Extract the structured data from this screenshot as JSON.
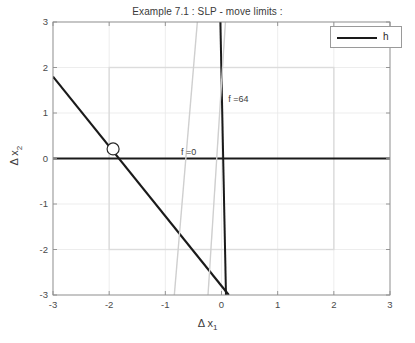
{
  "figure": {
    "title": "Example 7.1 : SLP - move limits :",
    "width": 415,
    "height": 343
  },
  "legend": {
    "entries": [
      {
        "label": "h",
        "color": "#1a1a1a"
      }
    ]
  },
  "chart_data": {
    "type": "line",
    "title": "Example 7.1 : SLP - move limits :",
    "xlabel": "Δ x₁",
    "ylabel": "Δ x₂",
    "xlabel_base": "Δ x",
    "xlabel_sub": "1",
    "ylabel_base": "Δ x",
    "ylabel_sub": "2",
    "xlim": [
      -3,
      3
    ],
    "ylim": [
      -3,
      3
    ],
    "xticks": [
      -3,
      -2,
      -1,
      0,
      1,
      2,
      3
    ],
    "yticks": [
      -3,
      -2,
      -1,
      0,
      1,
      2,
      3
    ],
    "xticklabels": [
      "-3",
      "-2",
      "-1",
      "0",
      "1",
      "2",
      "3"
    ],
    "yticklabels": [
      "-3",
      "-2",
      "-1",
      "0",
      "1",
      "2",
      "3"
    ],
    "grid": true,
    "grid_color": "#e8e8e8",
    "legend_position": "top-right",
    "series": [
      {
        "name": "h",
        "type": "line",
        "color": "#1a1a1a",
        "width": 2.2,
        "points": [
          [
            -3,
            1.8
          ],
          [
            0.13,
            -3
          ]
        ]
      },
      {
        "name": "f =64 constraint",
        "type": "line",
        "color": "#1a1a1a",
        "width": 2.0,
        "points": [
          [
            -0.02,
            3
          ],
          [
            0.08,
            -3
          ]
        ]
      },
      {
        "name": "axis-x-zero",
        "type": "line",
        "color": "#1a1a1a",
        "width": 2.0,
        "points": [
          [
            -3,
            0
          ],
          [
            3,
            0
          ]
        ]
      },
      {
        "name": "move-limit-line-left",
        "type": "line",
        "color": "#cfcfcf",
        "width": 1.4,
        "points": [
          [
            -0.43,
            3
          ],
          [
            -0.84,
            -3
          ]
        ]
      },
      {
        "name": "move-limit-line-right",
        "type": "line",
        "color": "#cfcfcf",
        "width": 1.4,
        "points": [
          [
            0.07,
            3
          ],
          [
            -0.24,
            -3
          ]
        ]
      }
    ],
    "box": {
      "name": "move-limits-box",
      "x_min": -2,
      "x_max": 2,
      "y_min": -2,
      "y_max": 2,
      "color": "#dcdcdc",
      "width": 1.4
    },
    "markers": [
      {
        "name": "design-point",
        "x": -1.93,
        "y": 0.21,
        "shape": "circle",
        "facecolor": "#ffffff",
        "edgecolor": "#2a2a2a",
        "size": 6
      }
    ],
    "annotations": [
      {
        "name": "f-zero-label",
        "text": "f =0",
        "x": -0.72,
        "y": 0.12
      },
      {
        "name": "f-64-label",
        "text": "f =64",
        "x": 0.12,
        "y": 1.28
      }
    ]
  }
}
